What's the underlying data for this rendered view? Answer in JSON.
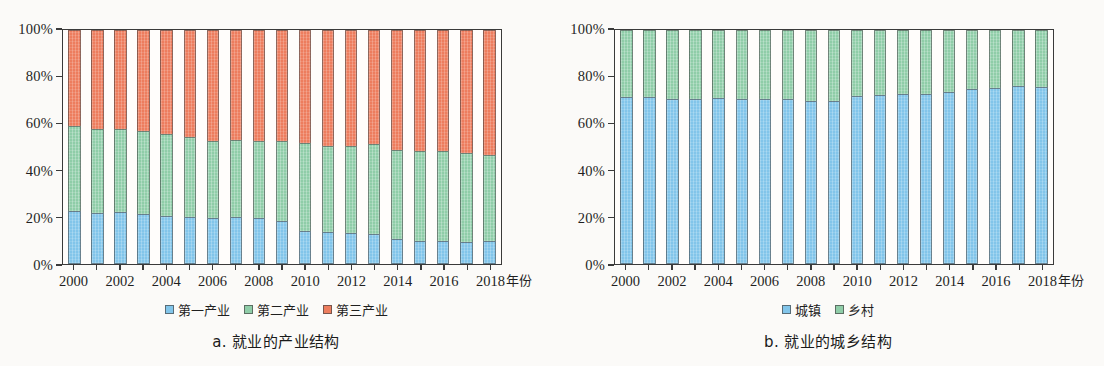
{
  "figure": {
    "background_color": "#fbfaf8",
    "colors": {
      "industry_primary": "#82c5ea",
      "industry_secondary": "#8fcda8",
      "industry_tertiary": "#ed7d5e",
      "urban": "#82c5ea",
      "rural": "#8fcda8",
      "axis": "#3a3a3a"
    }
  },
  "panel_a": {
    "caption": "a. 就业的产业结构",
    "axis_unit": "年份",
    "legend": [
      {
        "label": "第一产业",
        "color": "#82c5ea"
      },
      {
        "label": "第二产业",
        "color": "#8fcda8"
      },
      {
        "label": "第三产业",
        "color": "#ed7d5e"
      }
    ],
    "ytick_labels": [
      "0%",
      "20%",
      "40%",
      "60%",
      "80%",
      "100%"
    ],
    "xtick_labels": [
      "2000",
      "2002",
      "2004",
      "2006",
      "2008",
      "2010",
      "2012",
      "2014",
      "2016",
      "2018"
    ]
  },
  "panel_b": {
    "caption": "b. 就业的城乡结构",
    "axis_unit": "年份",
    "legend": [
      {
        "label": "城镇",
        "color": "#82c5ea"
      },
      {
        "label": "乡村",
        "color": "#8fcda8"
      }
    ],
    "ytick_labels": [
      "0%",
      "20%",
      "40%",
      "60%",
      "80%",
      "100%"
    ],
    "xtick_labels": [
      "2000",
      "2002",
      "2004",
      "2006",
      "2008",
      "2010",
      "2012",
      "2014",
      "2016",
      "2018"
    ]
  },
  "chart_data": [
    {
      "type": "bar",
      "stacked": true,
      "normalized_percent": true,
      "title": "a. 就业的产业结构",
      "xlabel": "年份",
      "ylabel": "",
      "ylim": [
        0,
        100
      ],
      "yticks": [
        0,
        20,
        40,
        60,
        80,
        100
      ],
      "grid": false,
      "legend_position": "bottom",
      "categories": [
        "2000",
        "2001",
        "2002",
        "2003",
        "2004",
        "2005",
        "2006",
        "2007",
        "2008",
        "2009",
        "2010",
        "2011",
        "2012",
        "2013",
        "2014",
        "2015",
        "2016",
        "2017",
        "2018"
      ],
      "series": [
        {
          "name": "第一产业",
          "color": "#82c5ea",
          "values": [
            22.5,
            22.0,
            22.2,
            21.4,
            20.5,
            20.0,
            19.6,
            20.0,
            19.5,
            18.2,
            14.3,
            13.6,
            13.2,
            12.7,
            10.5,
            10.0,
            10.0,
            9.6,
            9.7
          ]
        },
        {
          "name": "第二产业",
          "color": "#8fcda8",
          "values": [
            36.5,
            35.8,
            35.5,
            35.5,
            35.2,
            34.3,
            32.8,
            32.8,
            32.9,
            34.2,
            37.5,
            36.8,
            37.3,
            38.6,
            38.2,
            38.2,
            38.1,
            38.0,
            36.9
          ]
        },
        {
          "name": "第三产业",
          "color": "#ed7d5e",
          "values": [
            41.0,
            42.2,
            42.3,
            43.1,
            44.3,
            45.7,
            47.6,
            47.2,
            47.6,
            47.6,
            48.2,
            49.6,
            49.5,
            48.7,
            51.3,
            51.8,
            51.9,
            52.4,
            53.4
          ]
        }
      ]
    },
    {
      "type": "bar",
      "stacked": true,
      "normalized_percent": true,
      "title": "b. 就业的城乡结构",
      "xlabel": "年份",
      "ylabel": "",
      "ylim": [
        0,
        100
      ],
      "yticks": [
        0,
        20,
        40,
        60,
        80,
        100
      ],
      "grid": false,
      "legend_position": "bottom",
      "categories": [
        "2000",
        "2001",
        "2002",
        "2003",
        "2004",
        "2005",
        "2006",
        "2007",
        "2008",
        "2009",
        "2010",
        "2011",
        "2012",
        "2013",
        "2014",
        "2015",
        "2016",
        "2017",
        "2018"
      ],
      "series": [
        {
          "name": "城镇",
          "color": "#82c5ea",
          "values": [
            71.5,
            71.3,
            70.6,
            70.4,
            71.0,
            70.5,
            70.6,
            70.5,
            69.8,
            69.5,
            71.6,
            72.3,
            72.5,
            72.6,
            73.5,
            75.0,
            75.3,
            76.0,
            75.8
          ]
        },
        {
          "name": "乡村",
          "color": "#8fcda8",
          "values": [
            28.5,
            28.7,
            29.4,
            29.6,
            29.0,
            29.5,
            29.4,
            29.5,
            30.2,
            30.5,
            28.4,
            27.7,
            27.5,
            27.4,
            26.5,
            25.0,
            24.7,
            24.0,
            24.2
          ]
        }
      ]
    }
  ]
}
